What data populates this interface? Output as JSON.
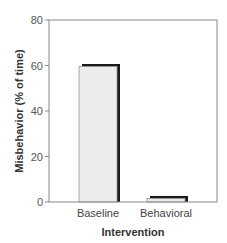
{
  "chart_data": {
    "type": "bar",
    "title": "",
    "xlabel": "Intervention",
    "ylabel": "Misbehavior (% of time)",
    "categories": [
      "Baseline",
      "Behavioral"
    ],
    "values": [
      60,
      2
    ],
    "ylim": [
      0,
      80
    ],
    "yticks": [
      "0",
      "20",
      "40",
      "60",
      "80"
    ],
    "grid": false,
    "legend": null,
    "bar_fill": "#ececec",
    "bar_shadow": "#1a1a1a"
  }
}
